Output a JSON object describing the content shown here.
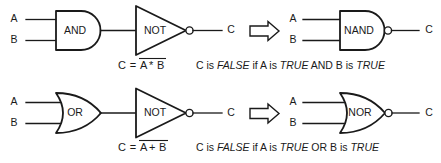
{
  "diagram": {
    "stroke_color": "#1a1a1a",
    "background_color": "#ffffff",
    "rows": [
      {
        "id": "nand-row",
        "source_gate_label": "AND",
        "inverter_label": "NOT",
        "equivalent_gate_label": "NAND",
        "input_labels": [
          "A",
          "B"
        ],
        "output_label": "C",
        "equiv_input_labels": [
          "A",
          "B"
        ],
        "equiv_output_label": "C",
        "equation": {
          "lhs": "C = ",
          "operand_a": "A",
          "operator": "*",
          "operand_b": "B",
          "full": "C = A * B (complemented)"
        },
        "caption": {
          "segments": [
            {
              "text": "C is ",
              "italic": false
            },
            {
              "text": "FALSE",
              "italic": true
            },
            {
              "text": " if A is ",
              "italic": false
            },
            {
              "text": "TRUE",
              "italic": true
            },
            {
              "text": " AND B is ",
              "italic": false
            },
            {
              "text": "TRUE",
              "italic": true
            }
          ],
          "full": "C is FALSE if A is TRUE AND B is TRUE"
        }
      },
      {
        "id": "nor-row",
        "source_gate_label": "OR",
        "inverter_label": "NOT",
        "equivalent_gate_label": "NOR",
        "input_labels": [
          "A",
          "B"
        ],
        "output_label": "C",
        "equiv_input_labels": [
          "A",
          "B"
        ],
        "equiv_output_label": "C",
        "equation": {
          "lhs": "C = ",
          "operand_a": "A",
          "operator": "+",
          "operand_b": "B",
          "full": "C = A + B (complemented)"
        },
        "caption": {
          "segments": [
            {
              "text": "C is ",
              "italic": false
            },
            {
              "text": "FALSE",
              "italic": true
            },
            {
              "text": " if A is ",
              "italic": false
            },
            {
              "text": "TRUE",
              "italic": true
            },
            {
              "text": " OR B is ",
              "italic": false
            },
            {
              "text": "TRUE",
              "italic": true
            }
          ],
          "full": "C is FALSE if A is TRUE OR B is TRUE"
        }
      }
    ],
    "equivalence_arrow": "hollow-right-arrow"
  }
}
